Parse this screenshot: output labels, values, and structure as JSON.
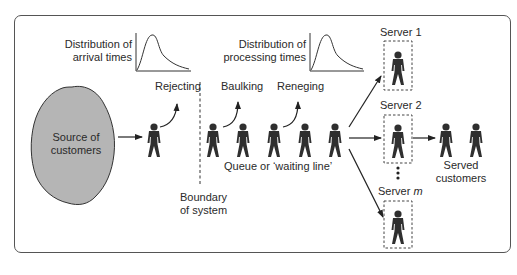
{
  "diagram": {
    "source": {
      "label_line1": "Source of",
      "label_line2": "customers"
    },
    "arrival_distribution": {
      "label_line1": "Distribution of",
      "label_line2": "arrival times"
    },
    "processing_distribution": {
      "label_line1": "Distribution of",
      "label_line2": "processing times"
    },
    "exits": {
      "rejecting": "Rejecting",
      "baulking": "Baulking",
      "reneging": "Reneging"
    },
    "queue_label": "Queue or ‘waiting line’",
    "boundary": {
      "label_line1": "Boundary",
      "label_line2": "of system"
    },
    "servers": [
      {
        "label": "Server 1"
      },
      {
        "label": "Server 2"
      },
      {
        "label_prefix": "Server ",
        "label_var": "m"
      }
    ],
    "served": {
      "label_line1": "Served",
      "label_line2": "customers"
    },
    "colors": {
      "cloud_fill": "#b5b5b5",
      "figure": "#2f2f2f",
      "stroke": "#333333",
      "frame": "#555555"
    }
  }
}
